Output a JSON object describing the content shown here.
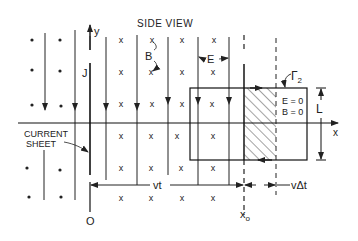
{
  "title": "SIDE VIEW",
  "labels": {
    "y_axis": "y",
    "x_axis": "x",
    "current_density": "J",
    "magnetic_field": "B",
    "electric_field": "E",
    "contour": "Γ",
    "contour_subscript": "2",
    "region_E": "E = 0",
    "region_B": "B = 0",
    "loop_height": "L",
    "current_sheet_line1": "CURRENT",
    "current_sheet_line2": "SHEET",
    "origin": "O",
    "wavefront_pos": "x",
    "wavefront_sub": "o",
    "distance_vt": "vt",
    "distance_vdt": "vΔt"
  },
  "symbols": {
    "field_out_of_page": "•",
    "field_into_page": "x"
  },
  "colors": {
    "ink": "#222222",
    "background": "#ffffff"
  }
}
